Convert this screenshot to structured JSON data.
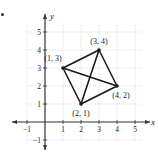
{
  "chart_data": {
    "type": "scatter",
    "title": "",
    "xlabel": "x",
    "ylabel": "y",
    "xlim": [
      -1.5,
      5.7
    ],
    "ylim": [
      -1.7,
      5.8
    ],
    "grid": true,
    "x_ticks": [
      -1,
      1,
      2,
      3,
      4,
      5
    ],
    "y_ticks": [
      -1,
      1,
      2,
      3,
      4,
      5
    ],
    "x_tick_labels": [
      "−1",
      "1",
      "2",
      "3",
      "4",
      "5"
    ],
    "y_tick_labels": [
      "−1",
      "1",
      "2",
      "3",
      "4",
      "5"
    ],
    "points": [
      {
        "x": 1,
        "y": 3,
        "label": "(1, 3)"
      },
      {
        "x": 3,
        "y": 4,
        "label": "(3, 4)"
      },
      {
        "x": 4,
        "y": 2,
        "label": "(4, 2)"
      },
      {
        "x": 2,
        "y": 1,
        "label": "(2, 1)"
      }
    ],
    "segments": [
      [
        [
          1,
          3
        ],
        [
          3,
          4
        ]
      ],
      [
        [
          3,
          4
        ],
        [
          4,
          2
        ]
      ],
      [
        [
          4,
          2
        ],
        [
          2,
          1
        ]
      ],
      [
        [
          2,
          1
        ],
        [
          1,
          3
        ]
      ],
      [
        [
          1,
          3
        ],
        [
          4,
          2
        ]
      ],
      [
        [
          3,
          4
        ],
        [
          2,
          1
        ]
      ]
    ],
    "annotations": [
      "(1, 3)",
      "(3, 4)",
      "(4, 2)",
      "(2, 1)"
    ]
  },
  "colors": {
    "axis": "#333333",
    "grid": "#cfcfcf",
    "line": "#1a1a1a",
    "text": "#222222"
  }
}
